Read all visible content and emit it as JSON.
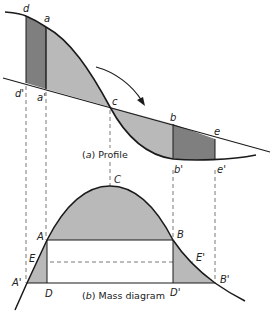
{
  "figure": {
    "profile": {
      "caption_prefix": "(",
      "caption_letter": "a",
      "caption_text": ") Profile",
      "point_labels": {
        "d": "d",
        "a": "a",
        "d_prime": "d'",
        "a_prime": "a'",
        "c": "c",
        "b": "b",
        "e": "e",
        "b_prime": "b'",
        "e_prime": "e'"
      }
    },
    "mass_diagram": {
      "caption_prefix": "(",
      "caption_letter": "b",
      "caption_text": ") Mass diagram",
      "point_labels": {
        "C": "C",
        "A": "A",
        "B": "B",
        "E": "E",
        "E_prime": "E'",
        "A_prime": "A'",
        "B_prime": "B'",
        "D": "D",
        "D_prime": "D'"
      }
    },
    "colors": {
      "light_fill": "#b9b9b9",
      "dark_fill": "#7f7f7f",
      "line": "#1a1a1a",
      "dashed": "#555555"
    }
  }
}
